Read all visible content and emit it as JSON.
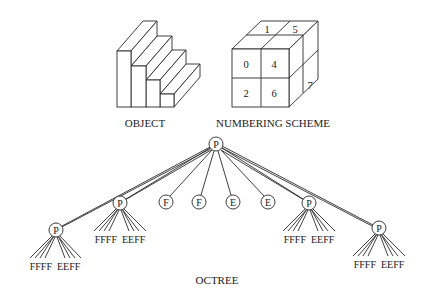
{
  "figure": {
    "object_caption": "OBJECT",
    "numbering_caption": "NUMBERING SCHEME",
    "octree_caption": "OCTREE"
  },
  "numbering_scheme": {
    "front_labels": [
      {
        "label": "0",
        "cell": "front-top-left"
      },
      {
        "label": "4",
        "cell": "front-top-right"
      },
      {
        "label": "2",
        "cell": "front-bottom-left"
      },
      {
        "label": "6",
        "cell": "front-bottom-right"
      }
    ],
    "top_labels": [
      {
        "label": "1",
        "cell": "top-back-left"
      },
      {
        "label": "5",
        "cell": "top-back-right"
      }
    ],
    "side_labels": [
      {
        "label": "7",
        "cell": "side-lower-back"
      }
    ]
  },
  "octree": {
    "root": {
      "label": "P"
    },
    "children": [
      {
        "label": "P",
        "leaves": "FFFF  EEFF"
      },
      {
        "label": "P",
        "leaves": "FFFF  EEFF"
      },
      {
        "label": "F"
      },
      {
        "label": "F"
      },
      {
        "label": "E"
      },
      {
        "label": "E"
      },
      {
        "label": "P",
        "leaves": "FFFF  EEFF"
      },
      {
        "label": "P",
        "leaves": "FFFF  EEFF"
      }
    ]
  },
  "colors": {
    "stroke": "#2a2a2a",
    "background": "#ffffff",
    "text": "#1a1a1a"
  }
}
